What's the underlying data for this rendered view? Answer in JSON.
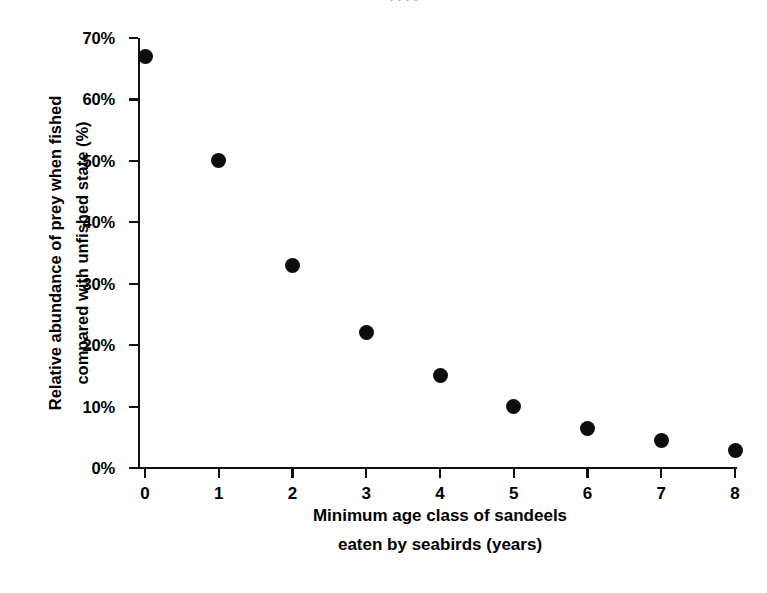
{
  "figure": {
    "background_color": "#ffffff",
    "marker_color": "#0d0d0d",
    "axis_color": "#111111",
    "top_bleed_text": "l l l J"
  },
  "chart_data": {
    "type": "scatter",
    "title": "",
    "subtitle": "",
    "xlabel_line1": "Minimum age class of sandeels",
    "xlabel_line2": "eaten by seabirds (years)",
    "ylabel_line1": "Relative abundance of prey when fished",
    "ylabel_line2": "compared with unfished state (%)",
    "x": [
      0,
      1,
      2,
      3,
      4,
      5,
      6,
      7,
      8
    ],
    "values": [
      67,
      50,
      33,
      22,
      15,
      10,
      6.5,
      4.5,
      2.8
    ],
    "xlim": [
      0,
      8
    ],
    "ylim": [
      0,
      70
    ],
    "xticks": [
      0,
      1,
      2,
      3,
      4,
      5,
      6,
      7,
      8
    ],
    "xtick_labels": [
      "0",
      "1",
      "2",
      "3",
      "4",
      "5",
      "6",
      "7",
      "8"
    ],
    "yticks": [
      0,
      10,
      20,
      30,
      40,
      50,
      60,
      70
    ],
    "ytick_labels": [
      "0%",
      "10%",
      "20%",
      "30%",
      "40%",
      "50%",
      "60%",
      "70%"
    ],
    "grid": false,
    "legend": null,
    "annotations": []
  }
}
